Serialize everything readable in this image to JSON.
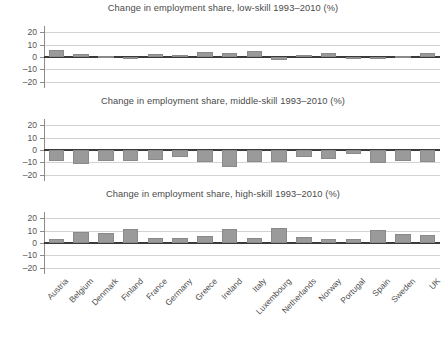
{
  "chart_data": [
    {
      "type": "bar",
      "title": "Change in employment share, low-skill 1993–2010 (%)",
      "xlabel": "",
      "ylabel": "",
      "ylim": [
        -25,
        25
      ],
      "yticks": [
        20,
        10,
        0,
        -10,
        -20
      ],
      "ytick_labels": [
        "20",
        "10",
        "0",
        "–10",
        "–20"
      ],
      "grid": true,
      "legend": "none",
      "categories": [
        "Austria",
        "Belgium",
        "Denmark",
        "Finland",
        "France",
        "Germany",
        "Greece",
        "Ireland",
        "Italy",
        "Luxembourg",
        "Netherlands",
        "Norway",
        "Portugal",
        "Spain",
        "Sweden",
        "UK"
      ],
      "values": [
        5.5,
        2.2,
        1.0,
        -1.5,
        2.8,
        1.8,
        4.0,
        3.0,
        5.2,
        -2.5,
        1.3,
        3.2,
        0.2,
        0.2,
        0.8,
        3.3
      ]
    },
    {
      "type": "bar",
      "title": "Change in employment share, middle-skill 1993–2010 (%)",
      "xlabel": "",
      "ylabel": "",
      "ylim": [
        -25,
        25
      ],
      "yticks": [
        20,
        10,
        0,
        -10,
        -20
      ],
      "ytick_labels": [
        "20",
        "10",
        "0",
        "–10",
        "–20"
      ],
      "grid": true,
      "legend": "none",
      "categories": [
        "Austria",
        "Belgium",
        "Denmark",
        "Finland",
        "France",
        "Germany",
        "Greece",
        "Ireland",
        "Italy",
        "Luxembourg",
        "Netherlands",
        "Norway",
        "Portugal",
        "Spain",
        "Sweden",
        "UK"
      ],
      "values": [
        -9.0,
        -11.5,
        -9.0,
        -9.2,
        -8.0,
        -5.5,
        -9.5,
        -14.0,
        -9.5,
        -9.5,
        -5.5,
        -7.0,
        -3.0,
        -10.5,
        -8.5,
        -9.5
      ]
    },
    {
      "type": "bar",
      "title": "Change in employment share, high-skill 1993–2010 (%)",
      "xlabel": "",
      "ylabel": "",
      "ylim": [
        -25,
        25
      ],
      "yticks": [
        20,
        10,
        0,
        -10,
        -20
      ],
      "ytick_labels": [
        "20",
        "10",
        "0",
        "–10",
        "–20"
      ],
      "grid": true,
      "legend": "none",
      "categories": [
        "Austria",
        "Belgium",
        "Denmark",
        "Finland",
        "France",
        "Germany",
        "Greece",
        "Ireland",
        "Italy",
        "Luxembourg",
        "Netherlands",
        "Norway",
        "Portugal",
        "Spain",
        "Sweden",
        "UK"
      ],
      "values": [
        3.5,
        8.5,
        8.0,
        11.5,
        4.0,
        4.0,
        5.5,
        11.0,
        4.0,
        12.5,
        5.0,
        3.0,
        3.5,
        10.5,
        7.5,
        6.5
      ]
    }
  ],
  "style": {
    "bar_color": "#9a9a9a",
    "grid_color": "#d2d2d2",
    "axis_color": "#8c8c8c",
    "zero_line_color": "#3a3a3a",
    "text_color": "#4a4a4a"
  }
}
